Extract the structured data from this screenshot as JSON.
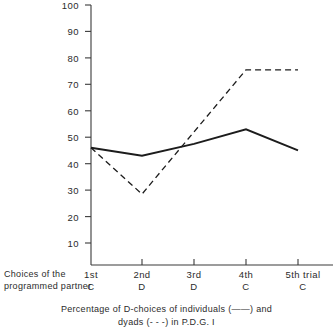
{
  "figure": {
    "left_caption_line1": "Choices of the",
    "left_caption_line2": "programmed partner",
    "bottom_caption_line1": "Percentage of D-choices of individuals (——) and",
    "bottom_caption_line2": "dyads (- - -) in P.D.G. I",
    "trial_suffix": "trial"
  },
  "chart_data": {
    "type": "line",
    "title": "Percentage of D-choices of individuals (——) and dyads (- - -) in P.D.G. I",
    "xlabel": "Choices of the programmed partner",
    "ylabel": "",
    "categories": [
      "1st",
      "2nd",
      "3rd",
      "4th",
      "5th"
    ],
    "partner_choices": [
      "C",
      "D",
      "D",
      "C",
      "C"
    ],
    "x_tick_labels": [
      "1st C",
      "2nd D",
      "3rd D",
      "4th C",
      "5th trial C"
    ],
    "y_ticks": [
      10,
      20,
      30,
      40,
      50,
      60,
      70,
      80,
      90,
      100
    ],
    "ylim": [
      0,
      100
    ],
    "grid": false,
    "legend": "inline-caption",
    "series": [
      {
        "name": "individuals",
        "style": "solid",
        "marker": "——",
        "values": [
          46,
          43,
          47.5,
          53,
          45
        ]
      },
      {
        "name": "dyads",
        "style": "dashed",
        "marker": "- - -",
        "values": [
          46,
          28.5,
          52,
          75.5,
          75.5
        ]
      }
    ]
  }
}
